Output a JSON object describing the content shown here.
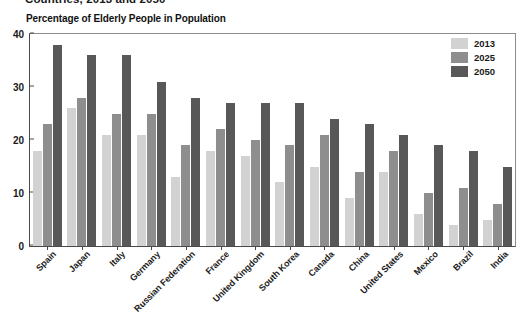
{
  "titles": {
    "main": "Countries, 2013 and 2050",
    "sub": "Percentage of Elderly People in Population"
  },
  "legend": {
    "items": [
      {
        "label": "2013",
        "color": "#d2d2d2"
      },
      {
        "label": "2025",
        "color": "#8e8e8e"
      },
      {
        "label": "2050",
        "color": "#585858"
      }
    ]
  },
  "axis": {
    "yticks": [
      "0",
      "10",
      "20",
      "30",
      "40"
    ]
  },
  "chart_data": {
    "type": "bar",
    "title": "Countries, 2013 and 2050",
    "subtitle": "Percentage of Elderly People in Population",
    "xlabel": "",
    "ylabel": "",
    "ylim": [
      0,
      40
    ],
    "yticks": [
      0,
      10,
      20,
      30,
      40
    ],
    "grid": false,
    "legend_position": "top-right",
    "categories": [
      "Spain",
      "Japan",
      "Italy",
      "Germany",
      "Russian Federation",
      "France",
      "United Kingdom",
      "South Korea",
      "Canada",
      "China",
      "United States",
      "Mexico",
      "Brazil",
      "India"
    ],
    "series": [
      {
        "name": "2013",
        "color": "#d2d2d2",
        "values": [
          18,
          26,
          21,
          21,
          13,
          18,
          17,
          12,
          15,
          9,
          14,
          6,
          4,
          5
        ]
      },
      {
        "name": "2025",
        "color": "#8e8e8e",
        "values": [
          23,
          28,
          25,
          25,
          19,
          22,
          20,
          19,
          21,
          14,
          18,
          10,
          11,
          8
        ]
      },
      {
        "name": "2050",
        "color": "#585858",
        "values": [
          38,
          36,
          36,
          31,
          28,
          27,
          27,
          27,
          24,
          23,
          21,
          19,
          18,
          15
        ]
      }
    ]
  }
}
